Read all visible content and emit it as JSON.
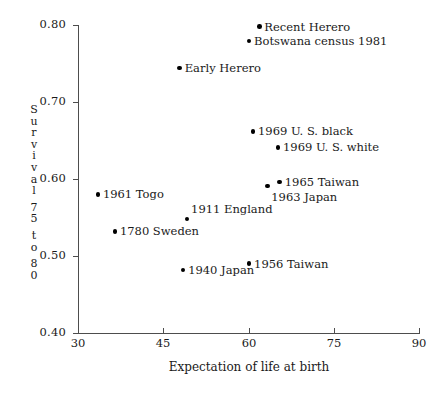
{
  "chart_data": {
    "type": "scatter",
    "title": "",
    "xlabel": "Expectation of life at birth",
    "ylabel": "Survival 75 to 80",
    "ylabel_chars": [
      "S",
      "u",
      "r",
      "v",
      "i",
      "v",
      "a",
      "l",
      "7",
      "5",
      "t",
      "o",
      "8",
      "0"
    ],
    "xlim": [
      30,
      90
    ],
    "ylim": [
      0.4,
      0.8
    ],
    "xticks": [
      30,
      45,
      60,
      75,
      90
    ],
    "xtick_labels": [
      "30",
      "45",
      "60",
      "75",
      "90"
    ],
    "yticks": [
      0.4,
      0.5,
      0.6,
      0.7,
      0.8
    ],
    "ytick_labels": [
      "0.40",
      "0.50",
      "0.60",
      "0.70",
      "0.80"
    ],
    "grid": false,
    "legend": "none",
    "marker_color": "#000000",
    "axis_color": "#4d4d4d",
    "points": [
      {
        "label": "Recent Herero",
        "x": 61.9,
        "y": 0.798,
        "label_side": "right"
      },
      {
        "label": "Botswana census 1981",
        "x": 60.1,
        "y": 0.779,
        "label_side": "right"
      },
      {
        "label": "Early Herero",
        "x": 47.9,
        "y": 0.744,
        "label_side": "right"
      },
      {
        "label": "1969 U. S. black",
        "x": 60.8,
        "y": 0.662,
        "label_side": "right"
      },
      {
        "label": "1969 U. S. white",
        "x": 65.2,
        "y": 0.641,
        "label_side": "right"
      },
      {
        "label": "1965 Taiwan",
        "x": 65.5,
        "y": 0.596,
        "label_side": "right"
      },
      {
        "label": "1963 Japan",
        "x": 63.3,
        "y": 0.591,
        "label_side": "below-right"
      },
      {
        "label": "1961 Togo",
        "x": 33.5,
        "y": 0.58,
        "label_side": "right"
      },
      {
        "label": "1911 England",
        "x": 49.2,
        "y": 0.548,
        "label_side": "above-right"
      },
      {
        "label": "1780 Sweden",
        "x": 36.5,
        "y": 0.532,
        "label_side": "right"
      },
      {
        "label": "1956 Taiwan",
        "x": 60.1,
        "y": 0.49,
        "label_side": "right"
      },
      {
        "label": "1940 Japan",
        "x": 48.5,
        "y": 0.482,
        "label_side": "right"
      }
    ]
  }
}
